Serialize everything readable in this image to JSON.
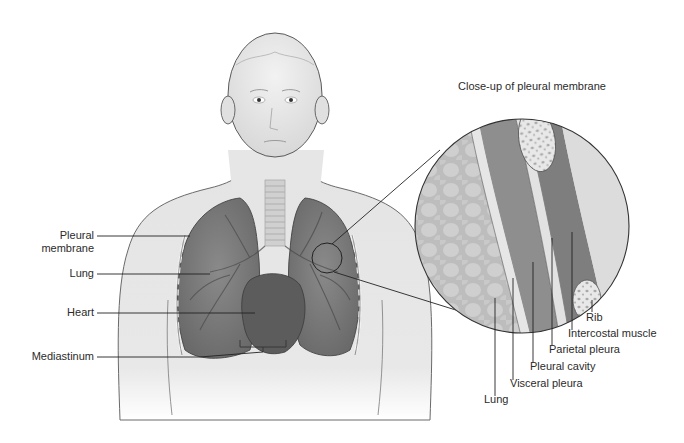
{
  "figure": {
    "title": "Close-up of pleural membrane",
    "left_labels": [
      {
        "id": "pleural-membrane",
        "line1": "Pleural",
        "line2": "membrane"
      },
      {
        "id": "lung",
        "line1": "Lung"
      },
      {
        "id": "heart",
        "line1": "Heart"
      },
      {
        "id": "mediastinum",
        "line1": "Mediastinum"
      }
    ],
    "closeup_labels": [
      {
        "id": "rib",
        "text": "Rib"
      },
      {
        "id": "intercostal-muscle",
        "text": "Intercostal muscle"
      },
      {
        "id": "parietal-pleura",
        "text": "Parietal pleura"
      },
      {
        "id": "pleural-cavity",
        "text": "Pleural cavity"
      },
      {
        "id": "visceral-pleura",
        "text": "Visceral pleura"
      },
      {
        "id": "lung",
        "text": "Lung"
      }
    ]
  }
}
